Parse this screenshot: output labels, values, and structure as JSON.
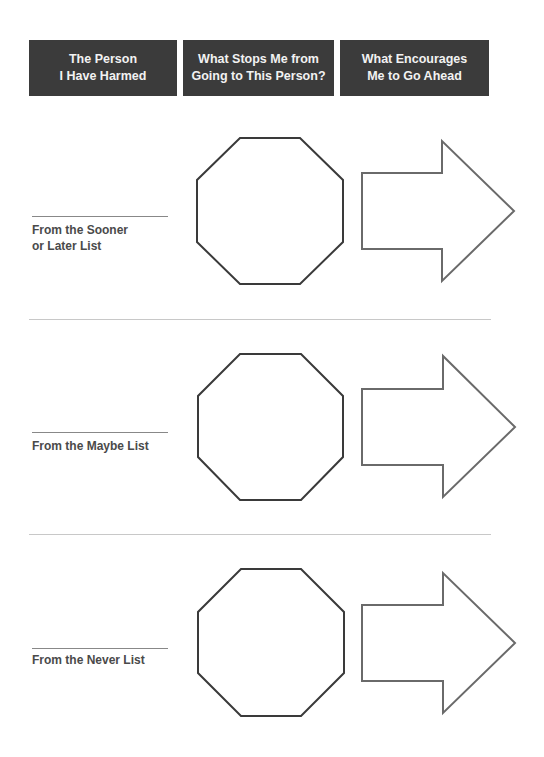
{
  "headers": [
    {
      "line1": "The Person",
      "line2": "I Have Harmed"
    },
    {
      "line1": "What Stops Me from",
      "line2": "Going to This Person?"
    },
    {
      "line1": "What Encourages",
      "line2": "Me to Go Ahead"
    }
  ],
  "rows": [
    {
      "label_line1": "From the Sooner",
      "label_line2": "or Later List",
      "stop_icon": "octagon-stop-sign",
      "go_icon": "right-arrow"
    },
    {
      "label_line1": "From the Maybe List",
      "label_line2": "",
      "stop_icon": "octagon-stop-sign",
      "go_icon": "right-arrow"
    },
    {
      "label_line1": "From the Never List",
      "label_line2": "",
      "stop_icon": "octagon-stop-sign",
      "go_icon": "right-arrow"
    }
  ],
  "colors": {
    "header_bg": "#3b3b3b",
    "header_text": "#f2f2f2",
    "stroke": "#3a3a3a",
    "label": "#4a4a4a"
  }
}
